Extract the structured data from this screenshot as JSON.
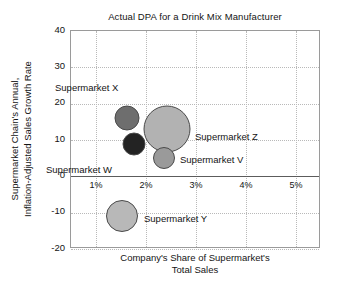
{
  "chart_data": {
    "type": "scatter",
    "title": "Actual DPA for a Drink Mix Manufacturer",
    "xlabel": "Company's Share of Supermarket's\nTotal Sales",
    "ylabel": "Supermarket Chain's Annual,\nInflation-Adjusted Sales Growth Rate",
    "xlim": [
      0.5,
      5.5
    ],
    "ylim": [
      -20,
      40
    ],
    "grid": true,
    "legend": "none",
    "xticks": [
      "1%",
      "2%",
      "3%",
      "4%",
      "5%"
    ],
    "xtick_values": [
      1,
      2,
      3,
      4,
      5
    ],
    "yticks": [
      "40",
      "30",
      "20",
      "10",
      "0",
      "-10",
      "-20"
    ],
    "ytick_values": [
      40,
      30,
      20,
      10,
      0,
      -10,
      -20
    ],
    "zero_line": 0,
    "points": [
      {
        "name": "Supermarket X",
        "x": 1.62,
        "y": 16,
        "size": 25,
        "color": "#6e6e6e",
        "label": "Supermarket X",
        "label_position": "upper-left"
      },
      {
        "name": "Supermarket W",
        "x": 1.76,
        "y": 9,
        "size": 23,
        "color": "#232323",
        "label": "Supermarket W",
        "label_position": "lower-left"
      },
      {
        "name": "Supermarket Z",
        "x": 2.42,
        "y": 13,
        "size": 47,
        "color": "#b2b2b2",
        "label": "Supermarket Z",
        "label_position": "right"
      },
      {
        "name": "Supermarket V",
        "x": 2.36,
        "y": 5,
        "size": 22,
        "color": "#9a9a9a",
        "label": "Supermarket V",
        "label_position": "right"
      },
      {
        "name": "Supermarket Y",
        "x": 1.52,
        "y": -11,
        "size": 32,
        "color": "#b8b8b8",
        "label": "Supermarket Y",
        "label_position": "right"
      }
    ]
  },
  "axes": {
    "title": "Actual DPA for a Drink Mix Manufacturer",
    "x_axis_title": "Company's Share of Supermarket's\nTotal Sales",
    "y_axis_title": "Supermarket Chain's Annual,\nInflation-Adjusted Sales Growth Rate",
    "x_tick_labels": [
      "1%",
      "2%",
      "3%",
      "4%",
      "5%"
    ],
    "y_tick_labels": [
      "40",
      "30",
      "20",
      "10",
      "0",
      "-10",
      "-20"
    ]
  },
  "labels": {
    "x_point": "Supermarket X",
    "w_point": "Supermarket W",
    "z_point": "Supermarket Z",
    "v_point": "Supermarket V",
    "y_point": "Supermarket Y"
  },
  "colors": {
    "frame": "#9a9a9a",
    "grid": "#b9b9b9",
    "zero_line": "#5c5c5c",
    "text": "#141414",
    "background": "#ffffff"
  }
}
